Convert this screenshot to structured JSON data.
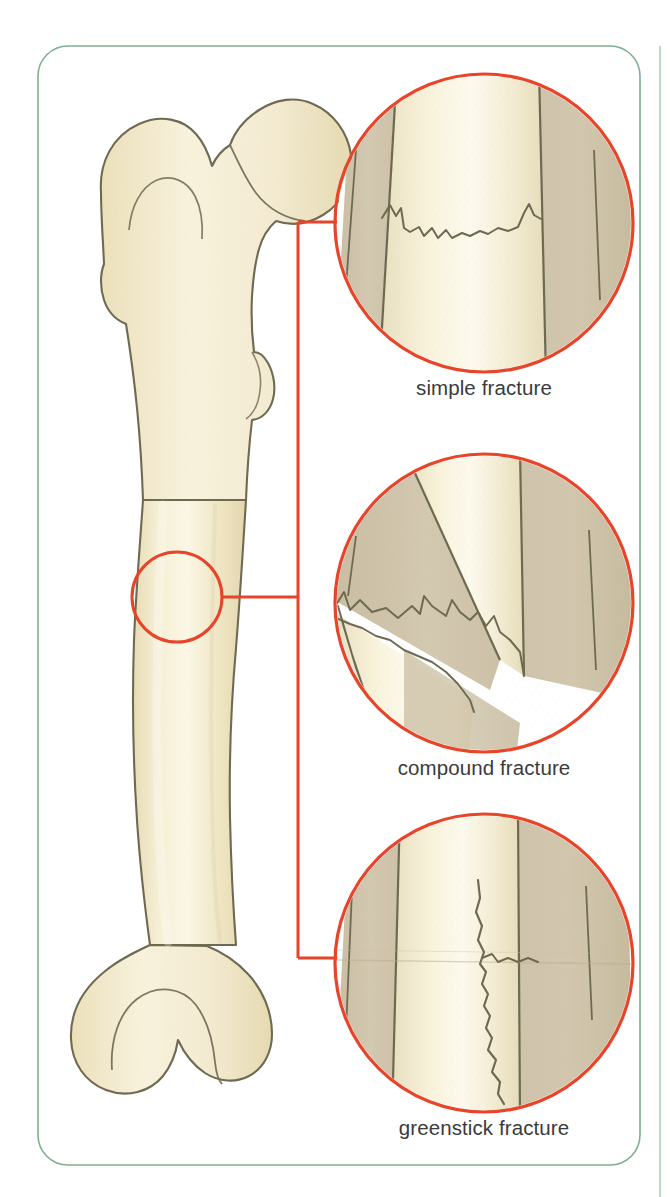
{
  "figure": {
    "frame": {
      "name": "page-border",
      "color": "#7fae92",
      "edge_line_color": "#8fbba1"
    }
  },
  "colors": {
    "bone_fill": "#f2e8c8",
    "bone_fill_light": "#faf4de",
    "bone_outline": "#6e6a52",
    "cortical_band": "#cfc4ab",
    "medullary_highlight": "#f7f0d8",
    "marker_red": "#e8442a",
    "caption_text": "#3b3b3b",
    "frame_green": "#7fae92"
  },
  "bone_diagram": {
    "name": "femur-illustration",
    "label": "femur",
    "fracture_site_marker": {
      "name": "fracture-site-circle",
      "color": "#e8442a",
      "center_x": 177,
      "center_y": 597,
      "radius": 45
    },
    "connector": {
      "name": "leader-bracket",
      "color": "#e8442a",
      "bracket_x": 298,
      "top_y": 222,
      "bottom_y": 958,
      "mid_y": 597
    }
  },
  "detail_circles": [
    {
      "id": "simple",
      "name": "detail-circle-simple-fracture",
      "caption": "simple fracture",
      "center_x": 484,
      "center_y": 223,
      "radius": 149,
      "fracture_description": "transverse break across the shaft, bone ends remain aligned"
    },
    {
      "id": "compound",
      "name": "detail-circle-compound-fracture",
      "caption": "compound fracture",
      "center_x": 484,
      "center_y": 603,
      "radius": 149,
      "fracture_description": "oblique displaced break, bone ends separated and out of alignment"
    },
    {
      "id": "greenstick",
      "name": "detail-circle-greenstick-fracture",
      "caption": "greenstick fracture",
      "center_x": 484,
      "center_y": 963,
      "radius": 149,
      "fracture_description": "incomplete longitudinal split, bone bent and cracked on one side"
    }
  ]
}
